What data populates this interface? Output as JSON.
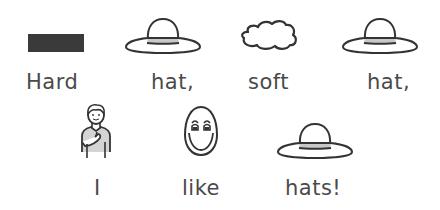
{
  "sentence": {
    "row1": [
      {
        "word": "Hard",
        "symbol": "dark-bar-icon"
      },
      {
        "word": "hat,",
        "symbol": "hat-icon"
      },
      {
        "word": "soft",
        "symbol": "cloud-icon"
      },
      {
        "word": "hat,",
        "symbol": "hat-icon"
      }
    ],
    "row2": [
      {
        "word": "I",
        "symbol": "person-pointing-self-icon"
      },
      {
        "word": "like",
        "symbol": "smiling-face-icon"
      },
      {
        "word": "hats!",
        "symbol": "hat-icon"
      }
    ]
  },
  "colors": {
    "text": "#4a4a4a",
    "stroke": "#333333",
    "hard_bar": "#3a3a3a",
    "hat_band": "#c8c8c8",
    "shirt": "#d4d4d4",
    "background": "#ffffff"
  }
}
